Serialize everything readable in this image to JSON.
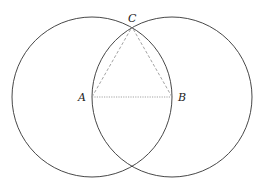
{
  "diagram": {
    "type": "geometric-construction",
    "circles": [
      {
        "name": "circle-A",
        "cx": 92,
        "cy": 97,
        "r": 80
      },
      {
        "name": "circle-B",
        "cx": 172,
        "cy": 97,
        "r": 80
      }
    ],
    "points": [
      {
        "id": "A",
        "label": "A",
        "x": 92,
        "y": 97,
        "lx": 78,
        "ly": 101
      },
      {
        "id": "B",
        "label": "B",
        "x": 172,
        "y": 97,
        "lx": 178,
        "ly": 101
      },
      {
        "id": "C",
        "label": "C",
        "x": 132,
        "y": 27,
        "lx": 128,
        "ly": 22
      }
    ],
    "segments": [
      {
        "from": "A",
        "to": "B",
        "style": "dotted"
      },
      {
        "from": "A",
        "to": "C",
        "style": "dashed"
      },
      {
        "from": "B",
        "to": "C",
        "style": "dashed"
      }
    ],
    "colors": {
      "circle": "#333333",
      "segment": "#999999",
      "label": "#222222"
    }
  }
}
